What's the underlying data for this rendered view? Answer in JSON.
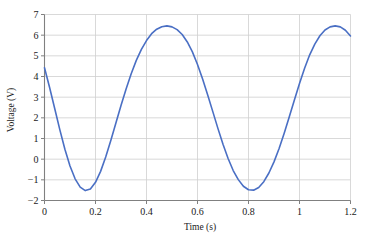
{
  "chart_data": {
    "type": "line",
    "title": "",
    "xlabel": "Time (s)",
    "ylabel": "Voltage (V)",
    "xlim": [
      0,
      1.2
    ],
    "ylim": [
      -2,
      7
    ],
    "xticks": [
      "0",
      "0.2",
      "0.4",
      "0.6",
      "0.8",
      "1",
      "1.2"
    ],
    "xtick_values": [
      0,
      0.2,
      0.4,
      0.6,
      0.8,
      1,
      1.2
    ],
    "yticks": [
      "7",
      "6",
      "5",
      "4",
      "3",
      "2",
      "1",
      "0",
      "-1",
      "-2"
    ],
    "ytick_values": [
      7,
      6,
      5,
      4,
      3,
      2,
      1,
      0,
      -1,
      -2
    ],
    "grid": true,
    "legend": "none",
    "line_color": "#4a6fc4",
    "grid_color": "#cfcfcf",
    "axis_color": "#808080",
    "series": [
      {
        "name": "Voltage",
        "amplitude": 4.0,
        "offset": 2.45,
        "period": 0.5,
        "peak_value": 6.45,
        "trough_value": -1.55,
        "peak_times": [
          0.41,
          0.91
        ],
        "trough_times": [
          0.16,
          0.66
        ],
        "x": [
          0,
          0.02,
          0.04,
          0.06,
          0.08,
          0.1,
          0.12,
          0.14,
          0.16,
          0.18,
          0.2,
          0.22,
          0.24,
          0.26,
          0.28,
          0.3,
          0.32,
          0.34,
          0.36,
          0.38,
          0.4,
          0.42,
          0.44,
          0.46,
          0.48,
          0.5,
          0.52,
          0.54,
          0.56,
          0.58,
          0.6,
          0.62,
          0.64,
          0.66,
          0.68,
          0.7,
          0.72,
          0.74,
          0.76,
          0.78,
          0.8,
          0.82,
          0.84,
          0.86,
          0.88,
          0.9,
          0.92,
          0.94,
          0.96,
          0.98,
          1.0,
          1.02,
          1.04,
          1.06,
          1.08,
          1.1,
          1.12,
          1.14,
          1.16,
          1.18,
          1.2
        ],
        "y": [
          4.42,
          3.47,
          2.45,
          1.43,
          0.48,
          -0.33,
          -0.95,
          -1.35,
          -1.52,
          -1.44,
          -1.12,
          -0.59,
          0.1,
          0.9,
          1.75,
          2.6,
          3.4,
          4.13,
          4.78,
          5.31,
          5.74,
          6.07,
          6.29,
          6.41,
          6.45,
          6.4,
          6.27,
          6.03,
          5.67,
          5.19,
          4.58,
          3.88,
          3.1,
          2.3,
          1.49,
          0.72,
          0.03,
          -0.55,
          -0.99,
          -1.31,
          -1.48,
          -1.5,
          -1.37,
          -1.09,
          -0.67,
          -0.13,
          0.52,
          1.26,
          2.05,
          2.86,
          3.66,
          4.4,
          5.05,
          5.57,
          5.97,
          6.25,
          6.4,
          6.45,
          6.4,
          6.24,
          5.96
        ]
      }
    ]
  }
}
